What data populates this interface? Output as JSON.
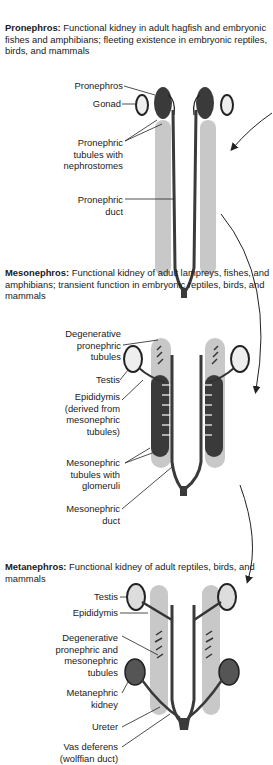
{
  "sections": [
    {
      "id": "pronephros",
      "title": "Pronephros:",
      "description": "Functional kidney in adult hagfish and embryonic fishes and amphibians; fleeting existence in embryonic reptiles, birds, and mammals",
      "labels": [
        "Pronephros",
        "Gonad",
        "Pronephric\ntubules with\nnephrostomes",
        "Pronephric\nduct"
      ]
    },
    {
      "id": "mesonephros",
      "title": "Mesonephros:",
      "description": "Functional kidney of adult lampreys, fishes, and amphibians; transient function in embryonic reptiles, birds, and mammals",
      "labels": [
        "Degenerative\npronephric\ntubules",
        "Testis",
        "Epididymis\n(derived from\nmesonephric\ntubules)",
        "Mesonephric\ntubules with\nglomeruli",
        "Mesonephric\nduct"
      ]
    },
    {
      "id": "metanephros",
      "title": "Metanephros:",
      "description": "Functional kidney of adult reptiles, birds, and mammals",
      "labels": [
        "Testis",
        "Epididymis",
        "Degenerative\npronephric and\nmesonephric\ntubules",
        "Metanephric\nkidney",
        "Ureter",
        "Vas deferens\n(wolffian duct)"
      ]
    }
  ],
  "colors": {
    "shade": "#c8c8c8",
    "dark": "#3a3a3a",
    "line": "#222222"
  }
}
